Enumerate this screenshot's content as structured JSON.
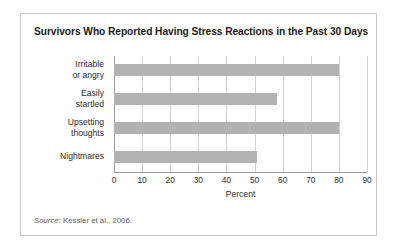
{
  "figure": {
    "title": "Survivors Who Reported Having Stress Reactions in the Past 30 Days",
    "source_lead": "Source:",
    "source_text": " Kessler et al., 2006.",
    "colors": {
      "bar": "#b2b2b2",
      "gridline": "#d2d2d2",
      "axis": "#9a9a9a",
      "frame": "#c9c9c9",
      "title_text": "#1a1a1a",
      "label_text": "#2b2b2b",
      "source_text": "#5e5e5e"
    }
  },
  "chart_data": {
    "type": "bar",
    "orientation": "horizontal",
    "title": "Survivors Who Reported Having Stress Reactions in the Past 30 Days",
    "xlabel": "Percent",
    "ylabel": "",
    "categories": [
      "Irritable\nor angry",
      "Easily\nstartled",
      "Upsetting\nthoughts",
      "Nightmares"
    ],
    "category_lines": [
      [
        "Irritable",
        "or angry"
      ],
      [
        "Easily",
        "startled"
      ],
      [
        "Upsetting",
        "thoughts"
      ],
      [
        "Nightmares"
      ]
    ],
    "values": [
      80,
      58,
      80,
      51
    ],
    "xlim": [
      0,
      90
    ],
    "xticks": [
      0,
      10,
      20,
      30,
      40,
      50,
      60,
      70,
      80,
      90
    ],
    "xtick_labels": [
      "0",
      "10",
      "20",
      "30",
      "40",
      "50",
      "60",
      "70",
      "80",
      "90"
    ],
    "grid": "vertical",
    "legend": "none",
    "source": "Source: Kessler et al., 2006."
  }
}
